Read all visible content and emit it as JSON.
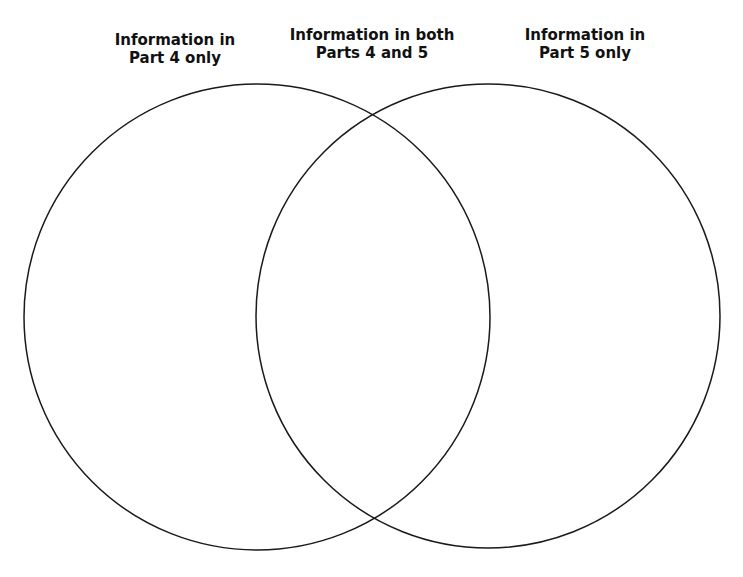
{
  "diagram": {
    "type": "venn",
    "labels": {
      "left": {
        "line1": "Information in",
        "line2": "Part 4 only"
      },
      "middle": {
        "line1": "Information in both",
        "line2": "Parts 4 and 5"
      },
      "right": {
        "line1": "Information in",
        "line2": "Part 5 only"
      }
    },
    "circles": [
      {
        "name": "part-4",
        "cx": 257,
        "cy": 317,
        "r": 233
      },
      {
        "name": "part-5",
        "cx": 488,
        "cy": 316,
        "r": 232
      }
    ],
    "stroke_color": "#1a1a1a"
  }
}
